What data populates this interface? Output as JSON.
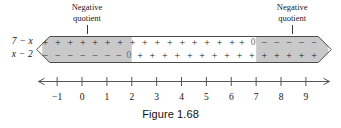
{
  "figure": {
    "caption": "Figure 1.68",
    "annotations": [
      {
        "line1": "Negative",
        "line2": "quotient",
        "x": 128,
        "y": 2
      },
      {
        "line1": "Negative",
        "line2": "quotient",
        "x": 290,
        "y": 2
      }
    ],
    "row_labels": [
      {
        "text": "7 − x",
        "row": "top"
      },
      {
        "text": "x − 2",
        "row": "bottom"
      }
    ],
    "band": {
      "shaded_color": "#c9c9c9",
      "unshaded_color": "#ffffff",
      "outline_color": "#4a4a4a",
      "shaded_regions": [
        {
          "from": -1.6,
          "to": 2.0
        },
        {
          "from": 7.0,
          "to": 9.9
        }
      ]
    },
    "rows": {
      "top": {
        "expression": "7 − x",
        "symbols": [
          {
            "s": "+",
            "x": -1.35
          },
          {
            "s": "+",
            "x": -0.85
          },
          {
            "s": "+",
            "x": -0.35
          },
          {
            "s": "+",
            "x": 0.15
          },
          {
            "s": "+",
            "x": 0.65
          },
          {
            "s": "+",
            "x": 1.15
          },
          {
            "s": "+",
            "x": 1.65
          },
          {
            "s": "+",
            "x": 2.15
          },
          {
            "s": "+",
            "x": 2.65
          },
          {
            "s": "+",
            "x": 3.15
          },
          {
            "s": "+",
            "x": 3.65
          },
          {
            "s": "+",
            "x": 4.15
          },
          {
            "s": "+",
            "x": 4.65
          },
          {
            "s": "+",
            "x": 5.15
          },
          {
            "s": "+",
            "x": 5.65
          },
          {
            "s": "+",
            "x": 6.15
          },
          {
            "s": "+",
            "x": 6.55
          },
          {
            "s": "0",
            "x": 7.0
          },
          {
            "s": "−",
            "x": 7.45
          },
          {
            "s": "−",
            "x": 7.95
          },
          {
            "s": "−",
            "x": 8.45
          },
          {
            "s": "−",
            "x": 8.95
          },
          {
            "s": "−",
            "x": 9.45
          }
        ]
      },
      "bottom": {
        "expression": "x − 2",
        "symbols": [
          {
            "s": "−",
            "x": -1.35
          },
          {
            "s": "−",
            "x": -0.85
          },
          {
            "s": "−",
            "x": -0.35
          },
          {
            "s": "−",
            "x": 0.15
          },
          {
            "s": "−",
            "x": 0.65
          },
          {
            "s": "−",
            "x": 1.15
          },
          {
            "s": "−",
            "x": 1.6
          },
          {
            "s": "0",
            "x": 2.0
          },
          {
            "s": "+",
            "x": 2.45
          },
          {
            "s": "+",
            "x": 2.95
          },
          {
            "s": "+",
            "x": 3.45
          },
          {
            "s": "+",
            "x": 3.95
          },
          {
            "s": "+",
            "x": 4.45
          },
          {
            "s": "+",
            "x": 4.95
          },
          {
            "s": "+",
            "x": 5.45
          },
          {
            "s": "+",
            "x": 5.95
          },
          {
            "s": "+",
            "x": 6.45
          },
          {
            "s": "+",
            "x": 6.95
          },
          {
            "s": "+",
            "x": 7.45
          },
          {
            "s": "+",
            "x": 7.95
          },
          {
            "s": "+",
            "x": 8.45
          },
          {
            "s": "+",
            "x": 8.95
          },
          {
            "s": "+",
            "x": 9.45
          }
        ]
      }
    },
    "number_line": {
      "min": -1,
      "max": 9,
      "ticks": [
        -1,
        0,
        1,
        2,
        3,
        4,
        5,
        6,
        7,
        8,
        9
      ],
      "tick_labels": [
        "−1",
        "0",
        "1",
        "2",
        "3",
        "4",
        "5",
        "6",
        "7",
        "8",
        "9"
      ],
      "axis_color": "#55565a",
      "arrows": "both"
    }
  },
  "chart_data": {
    "type": "line",
    "title": "Figure 1.68",
    "xlabel": "",
    "ylabel": "",
    "xlim": [
      -1,
      9
    ],
    "grid": false,
    "legend": "none",
    "categories": [
      "7 − x",
      "x − 2"
    ],
    "series": [
      {
        "name": "7 − x",
        "sign_intervals": [
          {
            "from": "−∞",
            "to": 7,
            "sign": "+"
          },
          {
            "at": 7,
            "sign": "0"
          },
          {
            "from": 7,
            "to": "∞",
            "sign": "−"
          }
        ]
      },
      {
        "name": "x − 2",
        "sign_intervals": [
          {
            "from": "−∞",
            "to": 2,
            "sign": "−"
          },
          {
            "at": 2,
            "sign": "0"
          },
          {
            "from": 2,
            "to": "∞",
            "sign": "+"
          }
        ]
      }
    ],
    "annotations": [
      {
        "text": "Negative quotient",
        "interval": "x < 2"
      },
      {
        "text": "Negative quotient",
        "interval": "x > 7"
      }
    ]
  }
}
